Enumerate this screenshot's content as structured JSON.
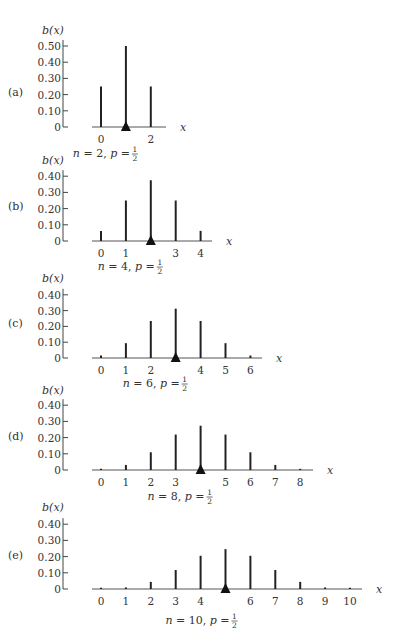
{
  "figure": {
    "y_axis_label": "b(x)",
    "x_axis_label": "x"
  },
  "chart_data": [
    {
      "type": "bar",
      "panel": "(a)",
      "caption": "n = 2,  p = 1/2",
      "n": 2,
      "p": "1/2",
      "x": [
        0,
        1,
        2
      ],
      "values": [
        0.25,
        0.5,
        0.25
      ],
      "x_tick_labels": [
        "0",
        "",
        "2"
      ],
      "y_ticks": [
        "0",
        "0.10",
        "0.20",
        "0.30",
        "0.40",
        "0.50"
      ],
      "ylim": [
        0,
        0.5
      ],
      "mean_marker": 1,
      "ylabel": "b(x)",
      "xlabel": "x"
    },
    {
      "type": "bar",
      "panel": "(b)",
      "caption": "n = 4,  p = 1/2",
      "n": 4,
      "p": "1/2",
      "x": [
        0,
        1,
        2,
        3,
        4
      ],
      "values": [
        0.0625,
        0.25,
        0.375,
        0.25,
        0.0625
      ],
      "x_tick_labels": [
        "0",
        "1",
        "",
        "3",
        "4"
      ],
      "y_ticks": [
        "0",
        "0.10",
        "0.20",
        "0.30",
        "0.40"
      ],
      "ylim": [
        0,
        0.4
      ],
      "mean_marker": 2,
      "ylabel": "b(x)",
      "xlabel": "x"
    },
    {
      "type": "bar",
      "panel": "(c)",
      "caption": "n = 6,  p = 1/2",
      "n": 6,
      "p": "1/2",
      "x": [
        0,
        1,
        2,
        3,
        4,
        5,
        6
      ],
      "values": [
        0.0156,
        0.0938,
        0.2344,
        0.3125,
        0.2344,
        0.0938,
        0.0156
      ],
      "x_tick_labels": [
        "0",
        "1",
        "2",
        "",
        "4",
        "5",
        "6"
      ],
      "y_ticks": [
        "0",
        "0.10",
        "0.20",
        "0.30",
        "0.40"
      ],
      "ylim": [
        0,
        0.4
      ],
      "mean_marker": 3,
      "ylabel": "b(x)",
      "xlabel": "x"
    },
    {
      "type": "bar",
      "panel": "(d)",
      "caption": "n = 8,  p = 1/2",
      "n": 8,
      "p": "1/2",
      "x": [
        0,
        1,
        2,
        3,
        4,
        5,
        6,
        7,
        8
      ],
      "values": [
        0.0039,
        0.0313,
        0.1094,
        0.2188,
        0.2734,
        0.2188,
        0.1094,
        0.0313,
        0.0039
      ],
      "x_tick_labels": [
        "0",
        "1",
        "2",
        "3",
        "",
        "5",
        "6",
        "7",
        "8"
      ],
      "y_ticks": [
        "0",
        "0.10",
        "0.20",
        "0.30",
        "0.40"
      ],
      "ylim": [
        0,
        0.4
      ],
      "mean_marker": 4,
      "ylabel": "b(x)",
      "xlabel": "x"
    },
    {
      "type": "bar",
      "panel": "(e)",
      "caption": "n = 10,  p = 1/2",
      "n": 10,
      "p": "1/2",
      "x": [
        0,
        1,
        2,
        3,
        4,
        5,
        6,
        7,
        8,
        9,
        10
      ],
      "values": [
        0.001,
        0.0098,
        0.0439,
        0.1172,
        0.2051,
        0.2461,
        0.2051,
        0.1172,
        0.0439,
        0.0098,
        0.001
      ],
      "x_tick_labels": [
        "0",
        "1",
        "2",
        "3",
        "4",
        "",
        "6",
        "7",
        "8",
        "9",
        "10"
      ],
      "y_ticks": [
        "0",
        "0.10",
        "0.20",
        "0.30",
        "0.40"
      ],
      "ylim": [
        0,
        0.4
      ],
      "mean_marker": 5,
      "ylabel": "b(x)",
      "xlabel": "x"
    }
  ],
  "layout": {
    "panels": [
      {
        "zero_y": 127,
        "px_per_unit": 162,
        "axis_end": 166,
        "ylabel_y": 30,
        "panel_label_y": 92,
        "caption_y": 153
      },
      {
        "zero_y": 241,
        "px_per_unit": 162,
        "axis_end": 212,
        "ylabel_y": 160,
        "panel_label_y": 206,
        "caption_y": 266
      },
      {
        "zero_y": 358,
        "px_per_unit": 158,
        "axis_end": 262,
        "ylabel_y": 278,
        "panel_label_y": 323,
        "caption_y": 383
      },
      {
        "zero_y": 470,
        "px_per_unit": 162,
        "axis_end": 313,
        "ylabel_y": 390,
        "panel_label_y": 436,
        "caption_y": 496
      },
      {
        "zero_y": 589,
        "px_per_unit": 162,
        "axis_end": 362,
        "ylabel_y": 507,
        "panel_label_y": 555,
        "caption_y": 620
      }
    ],
    "yaxis_x": 63,
    "x0": 101,
    "x_step": 24.9,
    "axis_start": 92
  }
}
